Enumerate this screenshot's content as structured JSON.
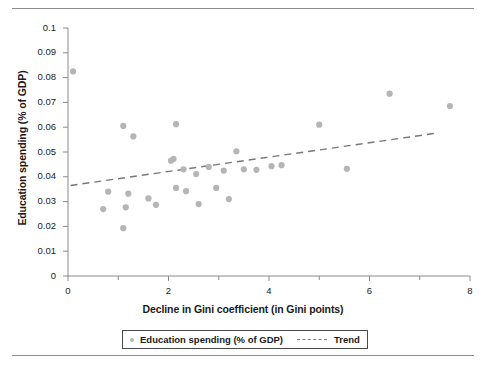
{
  "chart_data": {
    "type": "scatter",
    "title": "",
    "xlabel": "Decline in Gini coefficient (in Gini points)",
    "ylabel": "Education spending (% of GDP)",
    "xlim": [
      0,
      8
    ],
    "ylim": [
      0,
      0.1
    ],
    "grid": false,
    "xticks": [
      0,
      2,
      4,
      6,
      8
    ],
    "xtick_labels": [
      "0",
      "2",
      "4",
      "6",
      "8"
    ],
    "xminor_ticks": [
      1,
      3,
      5,
      7
    ],
    "yticks": [
      0,
      0.01,
      0.02,
      0.03,
      0.04,
      0.05,
      0.06,
      0.07,
      0.08,
      0.09,
      0.1
    ],
    "ytick_labels": [
      "0",
      "0.01",
      "0.02",
      "0.03",
      "0.04",
      "0.05",
      "0.06",
      "0.07",
      "0.08",
      "0.09",
      "0.1"
    ],
    "legend_position": "bottom",
    "marker_color": "#b5b5b5",
    "trend_color": "#777777",
    "series": [
      {
        "name": "Education spending (% of GDP)",
        "type": "scatter",
        "points": [
          [
            0.1,
            0.0825
          ],
          [
            0.7,
            0.027
          ],
          [
            0.8,
            0.034
          ],
          [
            1.1,
            0.0605
          ],
          [
            1.1,
            0.0193
          ],
          [
            1.15,
            0.0277
          ],
          [
            1.2,
            0.0332
          ],
          [
            1.3,
            0.0563
          ],
          [
            1.6,
            0.0313
          ],
          [
            1.75,
            0.0287
          ],
          [
            2.05,
            0.0465
          ],
          [
            2.1,
            0.0472
          ],
          [
            2.15,
            0.0612
          ],
          [
            2.15,
            0.0355
          ],
          [
            2.3,
            0.043
          ],
          [
            2.35,
            0.0342
          ],
          [
            2.55,
            0.0411
          ],
          [
            2.6,
            0.029
          ],
          [
            2.8,
            0.044
          ],
          [
            2.95,
            0.0355
          ],
          [
            3.1,
            0.0425
          ],
          [
            3.2,
            0.031
          ],
          [
            3.35,
            0.0503
          ],
          [
            3.5,
            0.043
          ],
          [
            3.75,
            0.0428
          ],
          [
            4.05,
            0.0443
          ],
          [
            4.25,
            0.0447
          ],
          [
            5.0,
            0.061
          ],
          [
            5.55,
            0.0432
          ],
          [
            6.4,
            0.0735
          ],
          [
            7.6,
            0.0685
          ]
        ]
      },
      {
        "name": "Trend",
        "type": "line",
        "style": "dashed",
        "points": [
          [
            0.05,
            0.0365
          ],
          [
            7.3,
            0.0575
          ]
        ]
      }
    ]
  },
  "legend": {
    "entries": [
      {
        "label": "Education spending (% of GDP)",
        "marker": "dot"
      },
      {
        "label": "Trend",
        "marker": "dashed-line"
      }
    ]
  },
  "axes": {
    "x_title": "Decline in Gini coefficient (in Gini points)",
    "y_title": "Education spending (% of GDP)"
  }
}
